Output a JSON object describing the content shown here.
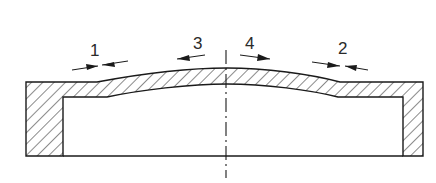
{
  "diagram": {
    "type": "cross-section",
    "colors": {
      "stroke": "#1a1a1a",
      "hatch": "#2a2a2a",
      "background": "#ffffff"
    },
    "labels": [
      {
        "id": "1",
        "text": "1",
        "arrow": "converging",
        "position": "left"
      },
      {
        "id": "3",
        "text": "3",
        "arrow": "pointing-left",
        "position": "center-left"
      },
      {
        "id": "4",
        "text": "4",
        "arrow": "pointing-right",
        "position": "center-right"
      },
      {
        "id": "2",
        "text": "2",
        "arrow": "converging",
        "position": "right"
      }
    ],
    "centerline": "dash-dot vertical axis of symmetry"
  }
}
